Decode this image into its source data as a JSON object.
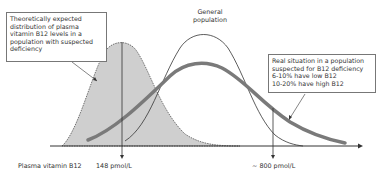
{
  "diagram": {
    "callout_left": {
      "lines": [
        "Theoretically expected",
        "distribution of plasma",
        "vitamin B12 levels in a",
        "population with suspected",
        "deficiency"
      ]
    },
    "callout_top": {
      "lines": [
        "General",
        "population"
      ]
    },
    "callout_right": {
      "lines": [
        "Real situation in a population",
        "suspected for B12 deficiency",
        "6-10% have low B12",
        "10-20% have high B12"
      ]
    },
    "axis": {
      "label": "Plasma vitamin B12",
      "threshold_low": "148 pmol/L",
      "threshold_high": "~ 800 pmol/L"
    },
    "colors": {
      "fill_gray": "#cfcfcf",
      "thick_curve": "#7a7a7a",
      "line": "#333333"
    }
  }
}
